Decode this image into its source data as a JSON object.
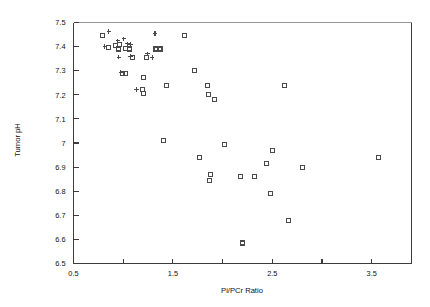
{
  "chart_data": {
    "type": "scatter",
    "title": "",
    "xlabel": "Pi/PCr Ratio",
    "ylabel": "Tumor pH",
    "xlim": [
      0.5,
      3.9
    ],
    "ylim": [
      6.5,
      7.5
    ],
    "grid": false,
    "legend": "none",
    "x_ticks": [
      0.5,
      1.0,
      1.5,
      2.0,
      2.5,
      3.0,
      3.5
    ],
    "x_tick_labels": [
      "0.5",
      "",
      "1.5",
      "",
      "2.5",
      "",
      "3.5"
    ],
    "y_ticks": [
      6.5,
      6.6,
      6.7,
      6.8,
      6.9,
      7.0,
      7.1,
      7.2,
      7.3,
      7.4,
      7.5
    ],
    "y_tick_labels": [
      "6.5",
      "6.6",
      "6.7",
      "6.8",
      "6.9",
      "7",
      "7.1",
      "7.2",
      "7.3",
      "7.4",
      "7.5"
    ],
    "series": [
      {
        "name": "square-markers",
        "marker": "square",
        "points": [
          [
            0.79,
            7.445
          ],
          [
            0.85,
            7.395
          ],
          [
            0.92,
            7.405
          ],
          [
            0.96,
            7.41
          ],
          [
            0.95,
            7.39
          ],
          [
            1.02,
            7.392
          ],
          [
            1.06,
            7.39
          ],
          [
            1.09,
            7.356
          ],
          [
            1.23,
            7.355
          ],
          [
            1.33,
            7.39
          ],
          [
            1.37,
            7.39
          ],
          [
            0.99,
            7.287
          ],
          [
            1.02,
            7.287
          ],
          [
            1.2,
            7.27
          ],
          [
            1.19,
            7.222
          ],
          [
            1.2,
            7.205
          ],
          [
            1.44,
            7.238
          ],
          [
            1.62,
            7.445
          ],
          [
            1.72,
            7.3
          ],
          [
            1.85,
            7.24
          ],
          [
            1.86,
            7.2
          ],
          [
            1.92,
            7.182
          ],
          [
            1.41,
            7.012
          ],
          [
            1.77,
            6.94
          ],
          [
            1.88,
            6.868
          ],
          [
            1.87,
            6.845
          ],
          [
            2.02,
            6.995
          ],
          [
            2.18,
            6.862
          ],
          [
            2.32,
            6.862
          ],
          [
            2.2,
            6.585
          ],
          [
            2.5,
            6.968
          ],
          [
            2.44,
            6.915
          ],
          [
            2.48,
            6.79
          ],
          [
            2.62,
            7.24
          ],
          [
            2.66,
            6.68
          ],
          [
            2.8,
            6.898
          ],
          [
            3.57,
            6.94
          ]
        ]
      },
      {
        "name": "plus-markers",
        "marker": "plus",
        "points": [
          [
            0.855,
            7.462
          ],
          [
            0.815,
            7.4
          ],
          [
            0.945,
            7.424
          ],
          [
            1.005,
            7.432
          ],
          [
            1.045,
            7.412
          ],
          [
            1.075,
            7.408
          ],
          [
            0.955,
            7.356
          ],
          [
            1.075,
            7.36
          ],
          [
            1.245,
            7.37
          ],
          [
            1.29,
            7.355
          ],
          [
            1.32,
            7.455
          ],
          [
            0.975,
            7.292
          ],
          [
            1.135,
            7.222
          ]
        ]
      }
    ]
  },
  "axes": {
    "x_title": "Pi/PCr Ratio",
    "y_title": "Tumor pH"
  }
}
